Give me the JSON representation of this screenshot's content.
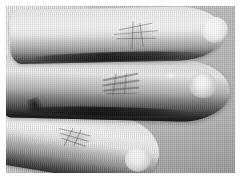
{
  "image": {
    "kind": "photograph",
    "subject": "hand-fingers-dorsal-view",
    "color_mode": "grayscale",
    "width_px": 241,
    "height_px": 179,
    "alt_text": "Black and white photograph showing the back of a hand with three fingers extended toward the right, each with prominent knuckle creases and bright fingertip highlights, against a light grey textured background.",
    "border": {
      "style": "solid-white-paper-margin",
      "thickness_px": 6,
      "color": "#ffffff"
    },
    "canvas": {
      "width_px": 229,
      "height_px": 167
    }
  },
  "palette": {
    "background_grey": "#bdbdbd",
    "skin_light": "#f4f4f4",
    "skin_mid": "#d2d2d2",
    "skin_shadow": "#7c7c7c",
    "gap_shadow": "#121212",
    "highlight_white": "#ffffff",
    "paper_white": "#ffffff"
  },
  "regions": {
    "background": {
      "label": "Background",
      "description": "Light grey textured surface with fine vertical scan lines"
    },
    "hand_back": {
      "label": "Back of hand",
      "description": "Dorsal hand mass entering from the left edge, showing fine skin texture and tendon shading"
    }
  },
  "fingers": [
    {
      "id": "index",
      "label": "Index finger",
      "position": "top",
      "direction": "pointing right",
      "tone": "light",
      "tip": {
        "label": "Index fingertip",
        "highlight": "bright specular white"
      },
      "knuckle": {
        "label": "Index knuckle",
        "creases": 5,
        "pattern": "cross-hatched callus"
      }
    },
    {
      "id": "middle",
      "label": "Middle finger",
      "position": "center",
      "direction": "pointing right",
      "tone": "dark",
      "tip": {
        "label": "Middle fingertip",
        "highlight": "bright specular white with secondary spark"
      },
      "knuckle": {
        "label": "Middle knuckle",
        "creases": 6,
        "pattern": "stacked horizontal ridges"
      }
    },
    {
      "id": "ring",
      "label": "Ring finger",
      "position": "bottom",
      "direction": "pointing right and angled down",
      "tone": "light",
      "tip": {
        "label": "Ring fingertip",
        "highlight": "bright specular white"
      },
      "knuckle": {
        "label": "Ring knuckle",
        "creases": 5,
        "pattern": "fine angled creases"
      }
    }
  ],
  "shadows": [
    {
      "id": "gap-index-middle",
      "label": "Shadow gap between index and middle finger"
    },
    {
      "id": "gap-middle-ring",
      "label": "Shadow gap between middle and ring finger"
    },
    {
      "id": "web-notch",
      "label": "Interdigital web notch shadow"
    }
  ],
  "overlays": {
    "grain": {
      "label": "Film grain and scan-line texture"
    },
    "tone": {
      "label": "Overall tonal gradient"
    }
  }
}
